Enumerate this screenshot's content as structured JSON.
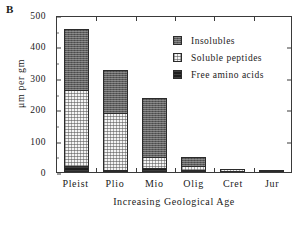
{
  "panel": {
    "letter": "B"
  },
  "axes": {
    "ylabel": "μm per gm",
    "xlabel": "Increasing Geological Age",
    "yticks": [
      "0",
      "100",
      "200",
      "300",
      "400",
      "500"
    ],
    "ylim": [
      0,
      500
    ]
  },
  "legend": {
    "items": [
      {
        "label": "Insolubles",
        "color": "#5e5e5e",
        "pattern": "dark-gray-stipple"
      },
      {
        "label": "Soluble peptides",
        "color": "#f4f4f4",
        "pattern": "light-dotted"
      },
      {
        "label": "Free amino acids",
        "color": "#1d1d1d",
        "pattern": "solid-black"
      }
    ]
  },
  "chart_data": {
    "type": "bar",
    "title": "",
    "subtitle": "",
    "xlabel": "Increasing Geological Age",
    "ylabel": "μm per gm",
    "ylim": [
      0,
      500
    ],
    "yticks": [
      0,
      100,
      200,
      300,
      400,
      500
    ],
    "grid": false,
    "stacked": true,
    "legend_position": "inside-top-right",
    "categories": [
      "Pleist",
      "Plio",
      "Mio",
      "Olig",
      "Cret",
      "Jur"
    ],
    "series": [
      {
        "name": "Free amino acids",
        "values": [
          20,
          6,
          14,
          5,
          3,
          1
        ]
      },
      {
        "name": "Soluble peptides",
        "values": [
          245,
          184,
          36,
          14,
          7,
          3
        ]
      },
      {
        "name": "Insolubles",
        "values": [
          195,
          140,
          190,
          29,
          0,
          0
        ]
      }
    ],
    "totals": [
      460,
      330,
      240,
      48,
      10,
      4
    ]
  }
}
